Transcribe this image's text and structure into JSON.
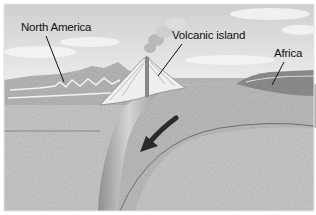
{
  "diagram": {
    "type": "geologic cross-section (subduction zone)",
    "labels": {
      "north_america": "North America",
      "volcanic_island": "Volcanic island",
      "africa": "Africa"
    },
    "arrow": {
      "direction": "down-left",
      "meaning": "plate subduction direction"
    },
    "colors": {
      "sky": "#d9d9d9",
      "ocean": "#a9a9a9",
      "crust": "#bdbdbd",
      "mantle": "#c4c4c4",
      "subducting_plate": "#9e9e9e",
      "volcano": "#ededed",
      "arrow": "#2a2a2a",
      "label_text": "#111111"
    }
  }
}
